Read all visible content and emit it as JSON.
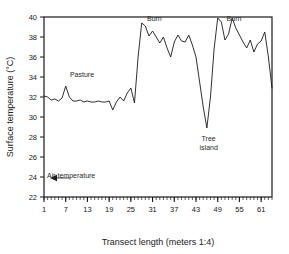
{
  "chart_data": {
    "type": "line",
    "title": "",
    "subtitle": "",
    "xlabel": "Transect length (meters 1:4)",
    "ylabel": "Surface temperature (°C)",
    "xlim": [
      1,
      64
    ],
    "ylim": [
      22,
      40
    ],
    "xticks": [
      1,
      7,
      13,
      19,
      25,
      31,
      37,
      43,
      49,
      55,
      61
    ],
    "yticks": [
      22,
      24,
      26,
      28,
      30,
      32,
      34,
      36,
      38,
      40
    ],
    "minor_xticks_every": 1,
    "grid": false,
    "legend": "none",
    "line_color": "#1a1a1a",
    "series": [
      {
        "name": "Surface temperature",
        "x": [
          1,
          2,
          3,
          4,
          5,
          6,
          7,
          8,
          9,
          10,
          11,
          12,
          13,
          14,
          15,
          16,
          17,
          18,
          19,
          20,
          21,
          22,
          23,
          24,
          25,
          26,
          27,
          28,
          29,
          30,
          31,
          32,
          33,
          34,
          35,
          36,
          37,
          38,
          39,
          40,
          41,
          42,
          43,
          44,
          45,
          46,
          47,
          48,
          49,
          50,
          51,
          52,
          53,
          54,
          55,
          56,
          57,
          58,
          59,
          60,
          61,
          62,
          63,
          64
        ],
        "values": [
          32.1,
          32.0,
          31.7,
          31.8,
          31.6,
          31.9,
          33.1,
          32.0,
          31.6,
          31.6,
          31.7,
          31.5,
          31.6,
          31.5,
          31.5,
          31.6,
          31.5,
          31.5,
          31.6,
          30.7,
          31.5,
          32.0,
          31.6,
          32.4,
          32.9,
          31.4,
          36.0,
          39.4,
          39.1,
          38.1,
          38.6,
          38.0,
          37.4,
          38.0,
          36.9,
          36.0,
          37.5,
          38.2,
          37.6,
          37.5,
          38.2,
          37.2,
          36.0,
          33.5,
          31.0,
          28.9,
          32.0,
          36.8,
          39.9,
          39.5,
          37.7,
          38.3,
          39.9,
          38.9,
          38.2,
          37.5,
          36.9,
          37.7,
          36.5,
          37.3,
          37.6,
          38.5,
          36.0,
          32.9
        ]
      }
    ],
    "annotations": [
      {
        "name": "pasture",
        "text": "Pasture",
        "x": 11.5,
        "y": 34.0
      },
      {
        "name": "burn-left",
        "text": "Burn",
        "x": 31.5,
        "y": 39.6
      },
      {
        "name": "tree-island-line1",
        "text": "Tree",
        "x": 46.5,
        "y": 27.6
      },
      {
        "name": "tree-island-line2",
        "text": "island",
        "x": 46.5,
        "y": 26.7
      },
      {
        "name": "burn-right",
        "text": "Burn",
        "x": 53.5,
        "y": 39.6
      },
      {
        "name": "air-temperature",
        "text": "Air temperature",
        "x": 8.5,
        "y": 23.9
      }
    ],
    "marker_annotation": {
      "name": "air-temperature-arrow",
      "label": "Air temperature",
      "y_value": 23.9,
      "direction": "left"
    }
  }
}
